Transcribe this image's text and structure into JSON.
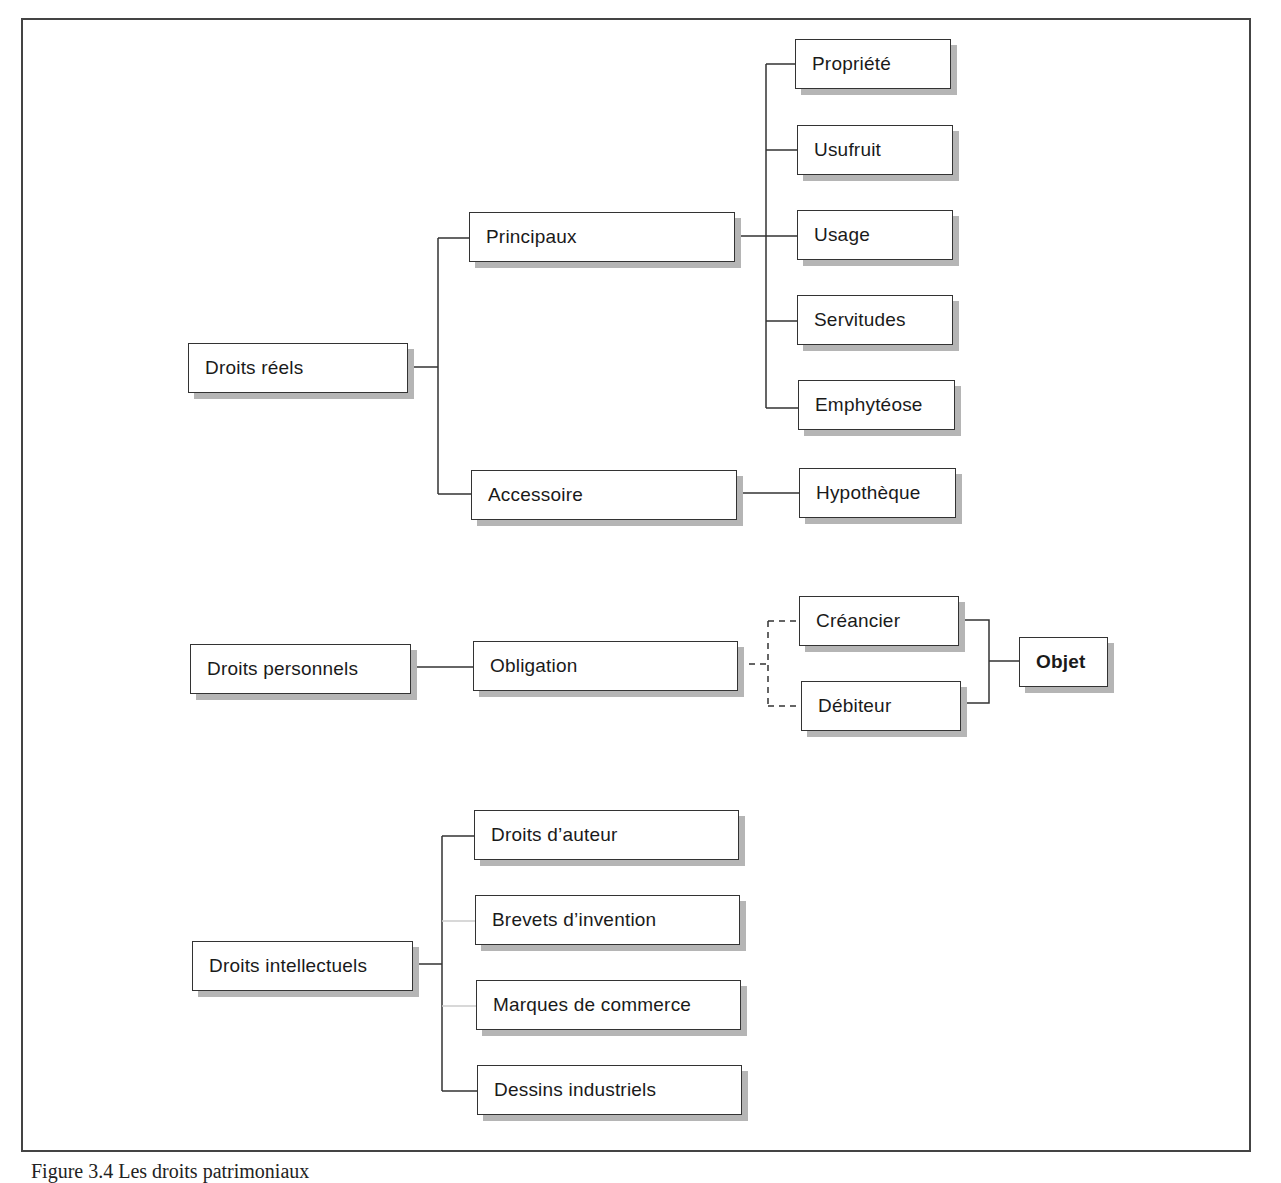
{
  "diagram": {
    "sections": [
      {
        "root": "Droits réels",
        "children": [
          {
            "label": "Principaux",
            "children": [
              "Propriété",
              "Usufruit",
              "Usage",
              "Servitudes",
              "Emphytéose"
            ]
          },
          {
            "label": "Accessoire",
            "children": [
              "Hypothèque"
            ]
          }
        ]
      },
      {
        "root": "Droits personnels",
        "children": [
          {
            "label": "Obligation",
            "children": [
              "Créancier",
              "Débiteur"
            ],
            "link_style": "dashed",
            "joins_to": "Objet"
          }
        ]
      },
      {
        "root": "Droits intellectuels",
        "children": [
          {
            "label": "Droits d’auteur"
          },
          {
            "label": "Brevets d’invention"
          },
          {
            "label": "Marques de commerce"
          },
          {
            "label": "Dessins industriels"
          }
        ]
      }
    ],
    "nodes": {
      "droits_reels": "Droits réels",
      "principaux": "Principaux",
      "accessoire": "Accessoire",
      "propriete": "Propriété",
      "usufruit": "Usufruit",
      "usage": "Usage",
      "servitudes": "Servitudes",
      "emphyteose": "Emphytéose",
      "hypotheque": "Hypothèque",
      "droits_personnels": "Droits personnels",
      "obligation": "Obligation",
      "creancier": "Créancier",
      "debiteur": "Débiteur",
      "objet": "Objet",
      "droits_intellectuels": "Droits intellectuels",
      "droits_auteur": "Droits d’auteur",
      "brevets": "Brevets d’invention",
      "marques": "Marques de commerce",
      "dessins": "Dessins industriels"
    }
  },
  "caption": "Figure 3.4 Les droits patrimoniaux"
}
